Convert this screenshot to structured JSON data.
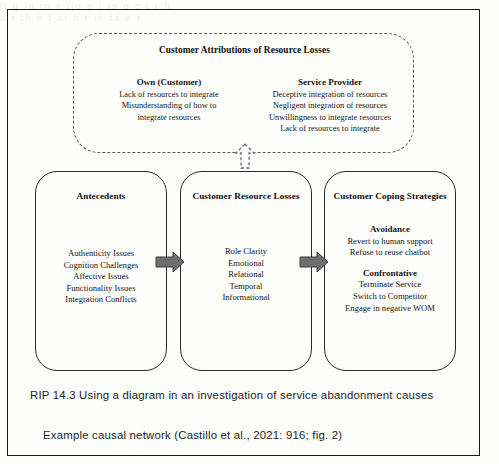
{
  "page": {
    "bleed_through": [
      "it  g    in  in a   tio   o   r   in    o  c  t    r    h",
      "o   r  th   n  t   ai       h    r   in     ta   e    r"
    ]
  },
  "attributions": {
    "title": "Customer Attributions of Resource Losses",
    "columns": [
      {
        "heading": "Own (Customer)",
        "lines": [
          "Lack of resources to integrate",
          "Misunderstanding of how to",
          "integrate resources"
        ]
      },
      {
        "heading": "Service Provider",
        "lines": [
          "Deceptive integration of resources",
          "Negligent integration of resources",
          "Unwillingness to integrate resources",
          "Lack of resources to integrate"
        ]
      }
    ]
  },
  "stages": [
    {
      "title": "Antecedents",
      "lines": [
        "Authenticity Issues",
        "Cognition Challenges",
        "Affective Issues",
        "Functionality Issues",
        "Integration Conflicts"
      ]
    },
    {
      "title": "Customer Resource Losses",
      "lines": [
        "Role Clarity",
        "Emotional",
        "Relational",
        "Temporal",
        "Informational"
      ]
    },
    {
      "title": "Customer Coping Strategies",
      "groups": [
        {
          "heading": "Avoidance",
          "lines": [
            "Revert to human support",
            "Refuse to reuse chatbot"
          ]
        },
        {
          "heading": "Confrontative",
          "lines": [
            "Terminate Service",
            "Switch to Competitor",
            "Engage in negative WOM"
          ]
        }
      ]
    }
  ],
  "connectors": {
    "arrow_1_label": "arrow-antecedents-to-losses",
    "arrow_2_label": "arrow-losses-to-coping",
    "up_arrow_label": "arrow-losses-to-attributions"
  },
  "captions": {
    "rip": "RIP 14.3 Using a diagram in an investigation of service abandonment causes",
    "example": "Example causal network (Castillo et al., 2021: 916; fig. 2)"
  },
  "colors": {
    "ink": "#1b1b1b",
    "arrow_fill": "#6e6e6e",
    "arrow_stroke": "#3d3d3d",
    "dashed_stroke": "#5b5b5b",
    "page_bg": "#fdfdfc"
  }
}
